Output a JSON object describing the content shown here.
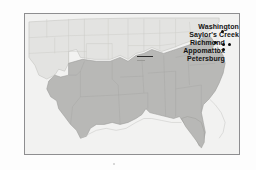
{
  "figure": {
    "kind": "historical-map",
    "title": "",
    "frame_color": "#8e8e90",
    "background_color": "#ffffff",
    "map_background_color": "#f2f2f1"
  },
  "map": {
    "region": "United States",
    "union_fill": "#e2e2e0",
    "confederate_fill": "#b9b9b7",
    "ocean_fill": "#f2f2f1",
    "state_border_color": "#c9c9c6",
    "region_border_color": "#9b9b98",
    "coast_color": "#b5b5b2"
  },
  "labels": [
    {
      "id": "washington",
      "text": "Washington"
    },
    {
      "id": "saylors-creek",
      "text": "Saylor's Creek"
    },
    {
      "id": "richmond",
      "text": "Richmond"
    },
    {
      "id": "appomattox",
      "text": "Appomattox"
    },
    {
      "id": "petersburg",
      "text": "Petersburg"
    }
  ],
  "markers": {
    "color": "#0a0a0a",
    "points": [
      {
        "id": "washington-dot",
        "x": 196,
        "y": 17
      },
      {
        "id": "saylors-creek-dot",
        "x": 190,
        "y": 28
      },
      {
        "id": "richmond-dot",
        "x": 198,
        "y": 30
      },
      {
        "id": "petersburg-dot",
        "x": 197,
        "y": 34
      },
      {
        "id": "appomattox-dot",
        "x": 203,
        "y": 31
      }
    ]
  }
}
